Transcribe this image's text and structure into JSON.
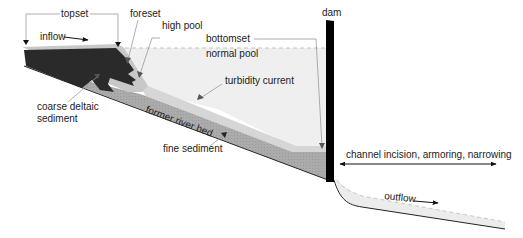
{
  "diagram": {
    "colors": {
      "background": "#ffffff",
      "water_pool": "#efefef",
      "high_pool_line": "#c4c4c4",
      "coarse_deltaic_sediment": "#2a2a2a",
      "topset_surface": "#c8c8c8",
      "turbidity_layer": "#d3d3d3",
      "fine_sediment": "#a9a9a9",
      "dam": "#000000",
      "riverbed_line": "#222222",
      "outflow_water": "#ececec",
      "leader_lines": "#9a9a9a"
    },
    "labels": {
      "topset": "topset",
      "foreset": "foreset",
      "high_pool": "high pool",
      "bottomset": "bottomset",
      "normal_pool": "normal pool",
      "dam": "dam",
      "inflow": "inflow",
      "turbidity_current": "turbidity current",
      "coarse_deltaic_sediment_line1": "coarse deltaic",
      "coarse_deltaic_sediment_line2": "sediment",
      "former_river_bed": "former river bed",
      "fine_sediment": "fine sediment",
      "channel_effects": "channel incision, armoring, narrowing",
      "outflow": "outflow"
    }
  }
}
